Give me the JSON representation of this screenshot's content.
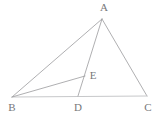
{
  "figure": {
    "canvas": {
      "width": 163,
      "height": 117,
      "background": "#ffffff"
    },
    "style": {
      "line_color": "#9a9b9d",
      "base_line_color": "#c7c8ca",
      "label_color": "#77787a",
      "line_width": 0.8,
      "base_line_width": 1.1,
      "label_font_size": 11
    },
    "points": [
      {
        "id": "A",
        "label": "A",
        "x": 102,
        "y": 19,
        "label_x": 104,
        "label_y": 11
      },
      {
        "id": "B",
        "label": "B",
        "x": 12,
        "y": 97,
        "label_x": 12,
        "label_y": 111
      },
      {
        "id": "C",
        "label": "C",
        "x": 147,
        "y": 96,
        "label_x": 148,
        "label_y": 111
      },
      {
        "id": "D",
        "label": "D",
        "x": 78,
        "y": 96,
        "label_x": 78,
        "label_y": 111
      },
      {
        "id": "E",
        "label": "E",
        "x": 85,
        "y": 76,
        "label_x": 93,
        "label_y": 79
      }
    ],
    "segments": [
      {
        "id": "AB",
        "from": "A",
        "to": "B",
        "kind": "side"
      },
      {
        "id": "AC",
        "from": "A",
        "to": "C",
        "kind": "side"
      },
      {
        "id": "BC",
        "from": "B",
        "to": "C",
        "kind": "base"
      },
      {
        "id": "AD",
        "from": "A",
        "to": "D",
        "kind": "cevian"
      },
      {
        "id": "BE",
        "from": "B",
        "to": "E",
        "kind": "cevian"
      }
    ]
  }
}
